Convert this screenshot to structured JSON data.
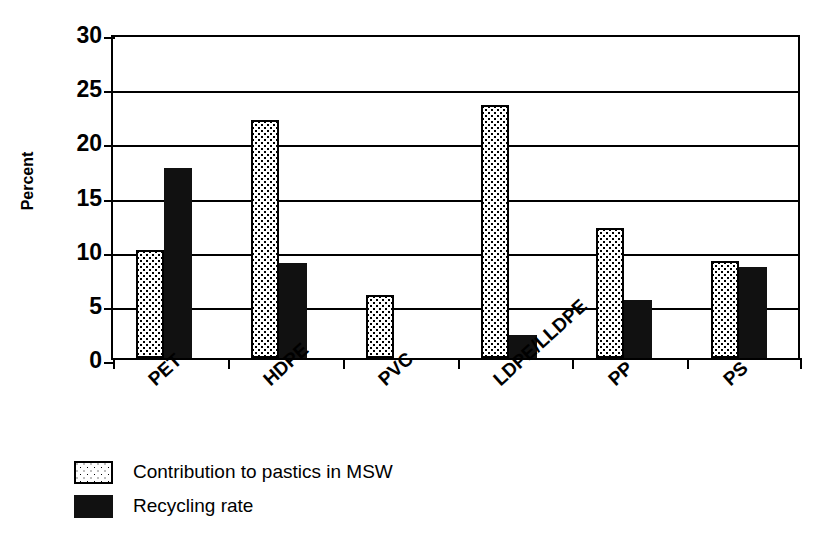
{
  "chart_data": {
    "type": "bar",
    "title": "",
    "xlabel": "",
    "ylabel": "Percent",
    "categories": [
      "PET",
      "HDPE",
      "PVC",
      "LDPE/LLDPE",
      "PP",
      "PS"
    ],
    "series": [
      {
        "name": "Contribution to pastics in MSW",
        "swatch": "dotted",
        "values": [
          10.0,
          22.0,
          5.8,
          23.4,
          12.0,
          9.0
        ]
      },
      {
        "name": "Recycling rate",
        "swatch": "solid-black",
        "values": [
          17.5,
          8.8,
          0,
          2.1,
          5.4,
          8.4
        ]
      }
    ],
    "ylim": [
      0,
      30
    ],
    "yticks": [
      0,
      5,
      10,
      15,
      20,
      25,
      30
    ],
    "ytick_labels": [
      "0",
      "5",
      "10",
      "15",
      "20",
      "25",
      "30"
    ],
    "grid": "horizontal",
    "legend_position": "below-axes-left",
    "colors": {
      "axis": "#000000",
      "grid": "#000000",
      "series_1_fill": "#ffffff",
      "series_1_pattern": "#000000",
      "series_2_fill": "#111111",
      "background": "#ffffff"
    }
  },
  "legend": {
    "items": [
      {
        "label": "Contribution to pastics in MSW",
        "swatch": "dotted"
      },
      {
        "label": "Recycling rate",
        "swatch": "solid-black"
      }
    ]
  }
}
